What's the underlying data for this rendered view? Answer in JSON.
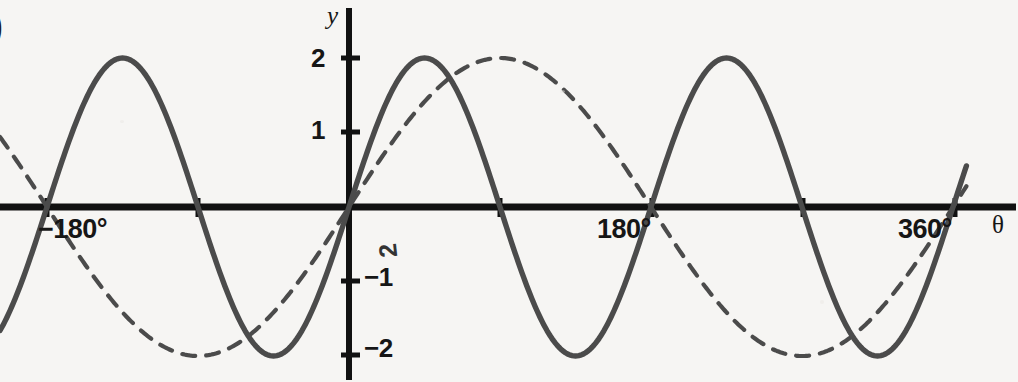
{
  "figure": {
    "background_color": "#f6f5f3",
    "axis_color": "#111111",
    "curve_color": "#4b4b4b",
    "partial_edge_glyph": ")",
    "stray_rotated_glyph": "2"
  },
  "axes": {
    "x_axis_label": "θ",
    "y_axis_label": "y",
    "x_ticks_labeled": [
      {
        "value": -180,
        "label": "−180°"
      },
      {
        "value": 180,
        "label": "180°"
      },
      {
        "value": 360,
        "label": "360°"
      }
    ],
    "x_ticks_unlabeled": [
      -90,
      90,
      270
    ],
    "y_ticks_labeled": [
      {
        "value": 2,
        "label": "2"
      },
      {
        "value": 1,
        "label": "1"
      },
      {
        "value": -1,
        "label": "−1"
      },
      {
        "value": -2,
        "label": "−2"
      }
    ]
  },
  "chart_data": {
    "type": "line",
    "title": "",
    "xlabel": "θ",
    "ylabel": "y",
    "xlim": [
      -208,
      368
    ],
    "ylim": [
      -2.35,
      2.35
    ],
    "grid": false,
    "legend": "none",
    "x_tick_labels": [
      "−180°",
      "180°",
      "360°"
    ],
    "x_tick_values": [
      -180,
      180,
      360
    ],
    "y_tick_labels": [
      "2",
      "1",
      "−1",
      "−2"
    ],
    "y_tick_values": [
      2,
      1,
      -1,
      -2
    ],
    "series": [
      {
        "name": "y = 2 sin 2θ",
        "style": "solid",
        "color": "#4b4b4b",
        "amplitude": 2,
        "period_degrees": 180,
        "phase_degrees": 0,
        "x": [
          -180,
          -135,
          -90,
          -45,
          0,
          45,
          90,
          135,
          180,
          225,
          270,
          315,
          360
        ],
        "y": [
          0,
          2,
          0,
          -2,
          0,
          2,
          0,
          -2,
          0,
          2,
          0,
          -2,
          0
        ]
      },
      {
        "name": "y = 2 sin θ",
        "style": "dashed",
        "color": "#4b4b4b",
        "amplitude": 2,
        "period_degrees": 360,
        "phase_degrees": 0,
        "x": [
          -180,
          -135,
          -90,
          -45,
          0,
          45,
          90,
          135,
          180,
          225,
          270,
          315,
          360
        ],
        "y": [
          0,
          -1.414,
          -2,
          -1.414,
          0,
          1.414,
          2,
          1.414,
          0,
          -1.414,
          -2,
          -1.414,
          0
        ]
      }
    ]
  }
}
